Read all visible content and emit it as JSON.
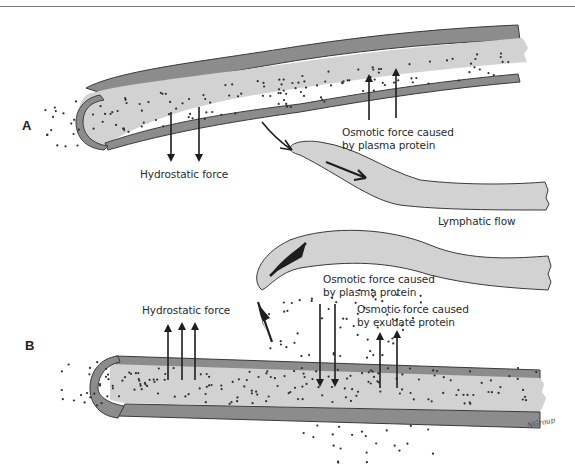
{
  "figure": {
    "panels": [
      {
        "letter": "A",
        "labels": {
          "hydrostatic": "Hydrostatic force",
          "osmotic_plasma_line1": "Osmotic force caused",
          "osmotic_plasma_line2": "by plasma protein"
        }
      },
      {
        "letter": "B",
        "labels": {
          "hydrostatic": "Hydrostatic force",
          "osmotic_plasma_line1": "Osmotic force caused",
          "osmotic_plasma_line2": "by plasma protein",
          "osmotic_exudate_line1": "Osmotic force caused",
          "osmotic_exudate_line2": "by exudate protein"
        }
      }
    ],
    "lymphatic_label": "Lymphatic flow",
    "signature": "NGroup",
    "colors": {
      "vessel_wall": "#8c8c8c",
      "vessel_fill": "#d2d2d2",
      "outline": "#3a3a3a",
      "particle": "#2e2e2e",
      "arrow": "#1e1e1e"
    }
  }
}
